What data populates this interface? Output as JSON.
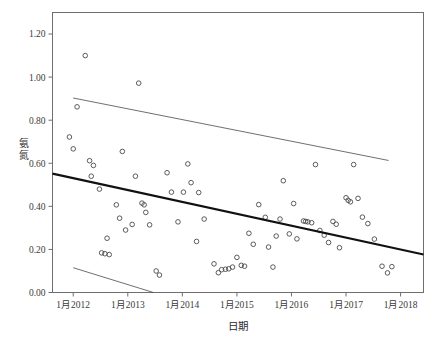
{
  "chart_data": {
    "type": "scatter",
    "title": "",
    "xlabel": "日期",
    "ylabel": "氨氮",
    "ylabel_chars": [
      "氨",
      "氮"
    ],
    "xlim": [
      2011.62,
      2018.42
    ],
    "ylim": [
      0.0,
      1.3
    ],
    "yticks": [
      0.0,
      0.2,
      0.4,
      0.6,
      0.8,
      1.0,
      1.2
    ],
    "ytick_labels": [
      "0.00",
      "0.20",
      "0.40",
      "0.60",
      "0.80",
      "1.00",
      "1.20"
    ],
    "xticks": [
      2012,
      2013,
      2014,
      2015,
      2016,
      2017,
      2018
    ],
    "xtick_labels": [
      "1月2012",
      "1月2013",
      "1月2014",
      "1月2015",
      "1月2016",
      "1月2017",
      "1月2018"
    ],
    "grid": false,
    "legend": null,
    "marker": "open-circle",
    "marker_color": "#4a4a4a",
    "fit_line_color": "#111111",
    "band_line_color": "#555555",
    "series": [
      {
        "name": "氨氮观测值",
        "type": "scatter",
        "points": [
          [
            2012.07,
            0.862
          ],
          [
            2012.22,
            1.1
          ],
          [
            2011.93,
            0.722
          ],
          [
            2012.0,
            0.667
          ],
          [
            2012.3,
            0.612
          ],
          [
            2012.37,
            0.59
          ],
          [
            2012.33,
            0.54
          ],
          [
            2012.48,
            0.48
          ],
          [
            2012.52,
            0.184
          ],
          [
            2012.58,
            0.18
          ],
          [
            2012.66,
            0.176
          ],
          [
            2012.62,
            0.252
          ],
          [
            2012.79,
            0.407
          ],
          [
            2012.85,
            0.345
          ],
          [
            2012.9,
            0.655
          ],
          [
            2012.96,
            0.29
          ],
          [
            2013.08,
            0.316
          ],
          [
            2013.2,
            0.972
          ],
          [
            2013.14,
            0.54
          ],
          [
            2013.26,
            0.415
          ],
          [
            2013.3,
            0.407
          ],
          [
            2013.33,
            0.372
          ],
          [
            2013.4,
            0.314
          ],
          [
            2013.52,
            0.1
          ],
          [
            2013.58,
            0.081
          ],
          [
            2013.72,
            0.556
          ],
          [
            2013.8,
            0.466
          ],
          [
            2013.92,
            0.328
          ],
          [
            2014.02,
            0.466
          ],
          [
            2014.1,
            0.597
          ],
          [
            2014.16,
            0.51
          ],
          [
            2014.3,
            0.464
          ],
          [
            2014.26,
            0.237
          ],
          [
            2014.4,
            0.341
          ],
          [
            2014.58,
            0.133
          ],
          [
            2014.66,
            0.092
          ],
          [
            2014.72,
            0.106
          ],
          [
            2014.79,
            0.108
          ],
          [
            2014.85,
            0.11
          ],
          [
            2014.92,
            0.118
          ],
          [
            2015.0,
            0.163
          ],
          [
            2015.08,
            0.126
          ],
          [
            2015.14,
            0.122
          ],
          [
            2015.22,
            0.275
          ],
          [
            2015.3,
            0.224
          ],
          [
            2015.4,
            0.408
          ],
          [
            2015.52,
            0.349
          ],
          [
            2015.58,
            0.211
          ],
          [
            2015.66,
            0.118
          ],
          [
            2015.72,
            0.262
          ],
          [
            2015.79,
            0.341
          ],
          [
            2015.85,
            0.519
          ],
          [
            2015.96,
            0.272
          ],
          [
            2016.04,
            0.413
          ],
          [
            2016.1,
            0.249
          ],
          [
            2016.22,
            0.332
          ],
          [
            2016.26,
            0.33
          ],
          [
            2016.3,
            0.328
          ],
          [
            2016.37,
            0.324
          ],
          [
            2016.44,
            0.594
          ],
          [
            2016.52,
            0.288
          ],
          [
            2016.6,
            0.266
          ],
          [
            2016.68,
            0.232
          ],
          [
            2016.76,
            0.33
          ],
          [
            2016.82,
            0.317
          ],
          [
            2016.88,
            0.208
          ],
          [
            2017.0,
            0.44
          ],
          [
            2017.04,
            0.428
          ],
          [
            2017.08,
            0.421
          ],
          [
            2017.14,
            0.594
          ],
          [
            2017.22,
            0.437
          ],
          [
            2017.3,
            0.35
          ],
          [
            2017.4,
            0.32
          ],
          [
            2017.52,
            0.248
          ],
          [
            2017.66,
            0.122
          ],
          [
            2017.76,
            0.091
          ],
          [
            2017.84,
            0.12
          ]
        ]
      }
    ],
    "fit_line": {
      "name": "线性趋势线",
      "x": [
        2011.62,
        2018.42
      ],
      "y": [
        0.552,
        0.176
      ]
    },
    "confidence_bands": [
      {
        "name": "上置信带",
        "x": [
          2012.0,
          2017.78
        ],
        "y": [
          0.903,
          0.613
        ]
      },
      {
        "name": "下置信带",
        "x": [
          2012.0,
          2013.47
        ],
        "y": [
          0.115,
          0.0
        ]
      }
    ]
  }
}
